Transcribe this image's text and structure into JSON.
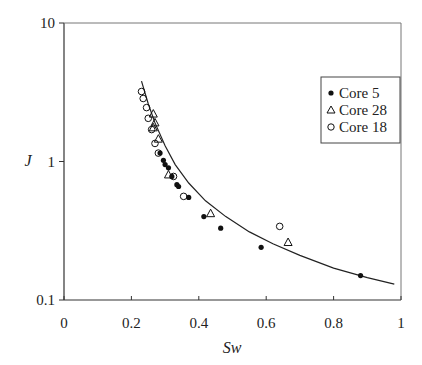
{
  "chart_data": {
    "type": "scatter",
    "title": "",
    "xlabel": "Sw",
    "ylabel": "J",
    "xlim": [
      0,
      1
    ],
    "ylim": [
      0.1,
      10
    ],
    "yscale": "log",
    "grid": false,
    "legend_position": "upper right",
    "x_ticks": [
      "0",
      "0.2",
      "0.4",
      "0.6",
      "0.8",
      "1"
    ],
    "y_ticks": [
      "0.1",
      "1",
      "10"
    ],
    "series": [
      {
        "name": "Core 5",
        "marker": "filled-circle",
        "points": [
          [
            0.285,
            1.15
          ],
          [
            0.295,
            1.02
          ],
          [
            0.3,
            0.95
          ],
          [
            0.31,
            0.9
          ],
          [
            0.32,
            0.78
          ],
          [
            0.335,
            0.68
          ],
          [
            0.34,
            0.66
          ],
          [
            0.37,
            0.55
          ],
          [
            0.415,
            0.4
          ],
          [
            0.465,
            0.33
          ],
          [
            0.585,
            0.24
          ],
          [
            0.88,
            0.15
          ]
        ]
      },
      {
        "name": "Core 28",
        "marker": "open-triangle",
        "points": [
          [
            0.265,
            2.2
          ],
          [
            0.27,
            1.9
          ],
          [
            0.265,
            1.75
          ],
          [
            0.28,
            1.45
          ],
          [
            0.31,
            0.8
          ],
          [
            0.435,
            0.42
          ],
          [
            0.665,
            0.26
          ]
        ]
      },
      {
        "name": "Core 18",
        "marker": "open-circle",
        "points": [
          [
            0.23,
            3.2
          ],
          [
            0.235,
            2.85
          ],
          [
            0.245,
            2.45
          ],
          [
            0.25,
            2.05
          ],
          [
            0.26,
            1.7
          ],
          [
            0.27,
            1.35
          ],
          [
            0.28,
            1.15
          ],
          [
            0.325,
            0.78
          ],
          [
            0.355,
            0.56
          ],
          [
            0.64,
            0.34
          ]
        ]
      }
    ],
    "fit_curve": {
      "name": "fit",
      "points": [
        [
          0.23,
          3.8
        ],
        [
          0.25,
          2.6
        ],
        [
          0.27,
          1.9
        ],
        [
          0.3,
          1.3
        ],
        [
          0.33,
          0.95
        ],
        [
          0.37,
          0.7
        ],
        [
          0.42,
          0.52
        ],
        [
          0.48,
          0.4
        ],
        [
          0.55,
          0.31
        ],
        [
          0.62,
          0.255
        ],
        [
          0.7,
          0.21
        ],
        [
          0.8,
          0.17
        ],
        [
          0.9,
          0.145
        ],
        [
          0.98,
          0.13
        ]
      ]
    }
  }
}
